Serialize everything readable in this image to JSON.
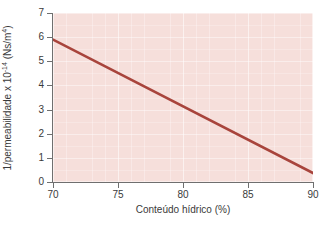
{
  "chart_data": {
    "type": "line",
    "title": "",
    "xlabel": "Conteúdo hídrico (%)",
    "ylabel_full": "1/permeabilidade x 10-14 (Ns/m4)",
    "ylabel_prefix": "1/permeabilidade x 10",
    "ylabel_exp1": "-14",
    "ylabel_mid": " (Ns/m",
    "ylabel_exp2": "4",
    "ylabel_suffix": ")",
    "xlim": [
      70,
      90
    ],
    "ylim": [
      0,
      7
    ],
    "xticks": [
      70,
      75,
      80,
      85,
      90
    ],
    "xticklabels": [
      "70",
      "75",
      "80",
      "85",
      "90"
    ],
    "yticks": [
      0,
      1,
      2,
      3,
      4,
      5,
      6,
      7
    ],
    "yticklabels": [
      "0",
      "1",
      "2",
      "3",
      "4",
      "5",
      "6",
      "7"
    ],
    "grid": true,
    "legend": false,
    "plot_background_color": "#f6dfdb",
    "series": [
      {
        "name": "1/permeabilidade",
        "color": "#a8443c",
        "linewidth": 2.6,
        "x": [
          70,
          90
        ],
        "y": [
          5.9,
          0.37
        ],
        "points": [
          {
            "x": 70,
            "y": 5.9
          },
          {
            "x": 75,
            "y": 4.52
          },
          {
            "x": 80,
            "y": 3.14
          },
          {
            "x": 85,
            "y": 1.75
          },
          {
            "x": 90,
            "y": 0.37
          }
        ]
      }
    ]
  }
}
